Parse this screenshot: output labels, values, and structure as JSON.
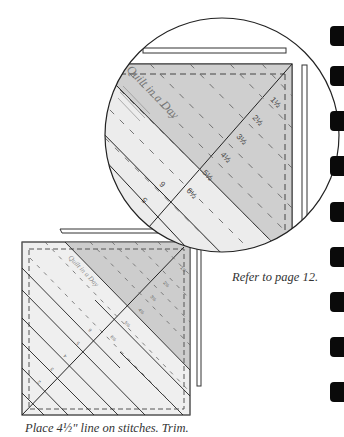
{
  "captions": {
    "refer": "Refer to page 12.",
    "instruction": "Place 4½\" line on stitches. Trim."
  },
  "ruler": {
    "brand": "Quilt in a Day",
    "large_labels": [
      "1½",
      "2½",
      "3½",
      "4½",
      "5½",
      "6½"
    ],
    "large_side_labels": [
      "6",
      "5"
    ],
    "small_labels": [
      "1½",
      "2½",
      "3½",
      "4½",
      "5½",
      "6½"
    ],
    "small_side_labels": [
      "6",
      "5",
      "4",
      "3",
      "2"
    ]
  },
  "edge_tabs": {
    "count": 9,
    "tops": [
      26,
      66,
      111,
      156,
      202,
      247,
      292,
      337,
      382
    ],
    "color": "#0a0a0a"
  },
  "colors": {
    "ruler_light": "#f0f0f0",
    "ruler_dark": "#cfcfcf",
    "line": "#222222",
    "dash": "#555555"
  }
}
